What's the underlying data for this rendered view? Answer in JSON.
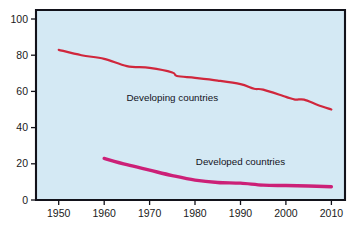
{
  "chart_data": {
    "type": "line",
    "title": "",
    "subtitle": "",
    "xlabel": "",
    "ylabel": "",
    "xlim": [
      1945,
      2013
    ],
    "ylim": [
      0,
      105
    ],
    "grid": false,
    "legend_position": "inline-annotations",
    "background_color": "#d4e9f4",
    "x_ticks": [
      1950,
      1960,
      1970,
      1980,
      1990,
      2000,
      2010
    ],
    "x_tick_labels": [
      "1950",
      "1960",
      "1970",
      "1980",
      "1990",
      "2000",
      "2010"
    ],
    "y_ticks": [
      0,
      20,
      40,
      60,
      80,
      100
    ],
    "y_tick_labels": [
      "0",
      "20",
      "40",
      "60",
      "80",
      "100"
    ],
    "series": [
      {
        "name": "Developing countries",
        "color": "#d0273c",
        "stroke_width": 2.2,
        "label_x": 1975,
        "label_y": 55,
        "x": [
          1950,
          1955,
          1960,
          1965,
          1970,
          1975,
          1976,
          1980,
          1985,
          1990,
          1993,
          1995,
          2000,
          2002,
          2004,
          2007,
          2010
        ],
        "values": [
          83,
          80,
          78,
          74,
          73,
          70.5,
          68.5,
          67.5,
          66,
          64,
          61.5,
          61,
          57,
          55.5,
          55.5,
          52.5,
          50
        ]
      },
      {
        "name": "Developed countries",
        "color": "#cc2077",
        "stroke_width": 3.4,
        "label_x": 1990,
        "label_y": 19.5,
        "x": [
          1960,
          1965,
          1970,
          1975,
          1980,
          1985,
          1990,
          1995,
          2000,
          2005,
          2010
        ],
        "values": [
          23,
          19.5,
          16.5,
          13.5,
          11,
          9.7,
          9.3,
          8.2,
          8,
          7.7,
          7.3
        ]
      }
    ]
  },
  "axes": {
    "y_tick_labels": [
      "100",
      "80",
      "60",
      "40",
      "20",
      "0"
    ],
    "x_tick_labels": [
      "1950",
      "1960",
      "1970",
      "1980",
      "1990",
      "2000",
      "2010"
    ]
  },
  "annotations": {
    "developing_label": "Developing countries",
    "developed_label": "Developed countries"
  }
}
